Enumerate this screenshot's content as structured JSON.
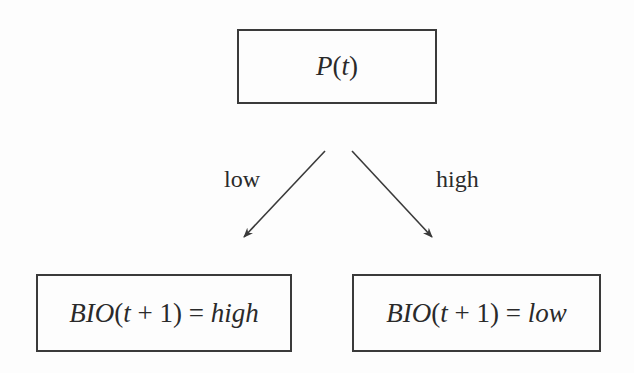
{
  "diagram": {
    "type": "decision-tree",
    "root": {
      "id": "root",
      "label_prefix": "P",
      "label_open": "(",
      "label_var": "t",
      "label_close": ")"
    },
    "edges": [
      {
        "from": "root",
        "to": "leaf-left",
        "label": "low"
      },
      {
        "from": "root",
        "to": "leaf-right",
        "label": "high"
      }
    ],
    "leaves": [
      {
        "id": "leaf-left",
        "func": "BIO",
        "open": "(",
        "var": "t",
        "plus": " + ",
        "num": "1",
        "close": ")",
        "eq": " = ",
        "value": "high"
      },
      {
        "id": "leaf-right",
        "func": "BIO",
        "open": "(",
        "var": "t",
        "plus": " + ",
        "num": "1",
        "close": ")",
        "eq": " = ",
        "value": "low"
      }
    ],
    "colors": {
      "stroke": "#3a3a3a",
      "text": "#2a2a2a",
      "background": "#fdfdfd"
    }
  }
}
